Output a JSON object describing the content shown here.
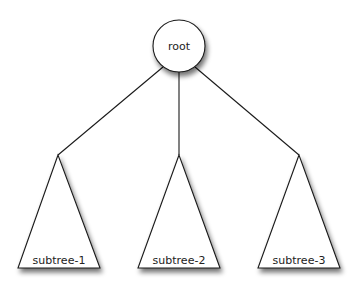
{
  "diagram": {
    "type": "tree",
    "root": {
      "label": "root",
      "cx": 179,
      "cy": 46,
      "r": 26
    },
    "subtrees": [
      {
        "label": "subtree-1",
        "apex": [
          58,
          155
        ],
        "base_left": [
          18,
          268
        ],
        "base_right": [
          100,
          268
        ]
      },
      {
        "label": "subtree-2",
        "apex": [
          179,
          155
        ],
        "base_left": [
          138,
          268
        ],
        "base_right": [
          220,
          268
        ]
      },
      {
        "label": "subtree-3",
        "apex": [
          299,
          155
        ],
        "base_left": [
          258,
          268
        ],
        "base_right": [
          340,
          268
        ]
      }
    ],
    "edges": [
      {
        "from": "root",
        "to": "subtree-1"
      },
      {
        "from": "root",
        "to": "subtree-2"
      },
      {
        "from": "root",
        "to": "subtree-3"
      }
    ],
    "colors": {
      "stroke": "#1a1a1a",
      "fill": "#ffffff",
      "shadow": "#000000"
    }
  }
}
